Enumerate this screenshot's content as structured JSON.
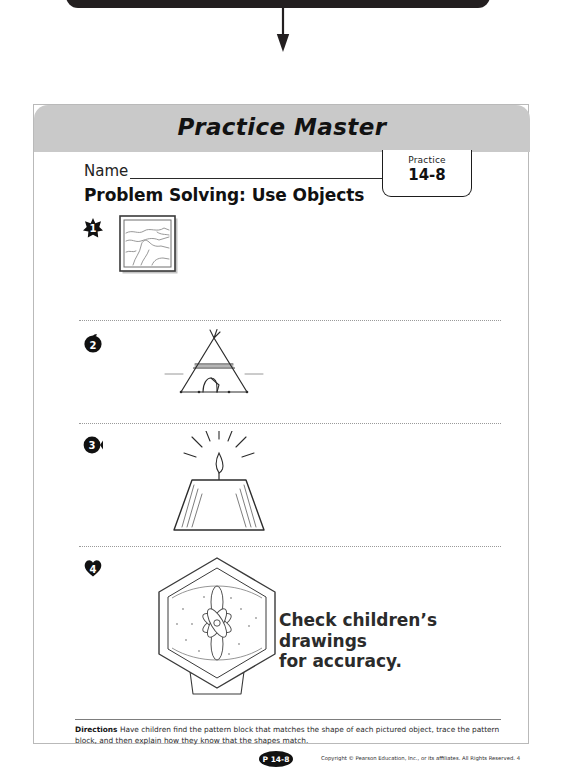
{
  "header": {
    "title": "Practice Master"
  },
  "name_field": {
    "label": "Name",
    "value": "",
    "placeholder": ""
  },
  "practice_tab": {
    "word": "Practice",
    "number": "14-8"
  },
  "lesson": {
    "title": "Problem Solving: Use Objects"
  },
  "problems": [
    {
      "number": "1",
      "marker_shape": "star",
      "art": "framed-landscape-picture",
      "art_description": "Square framed picture of a landscape"
    },
    {
      "number": "2",
      "marker_shape": "circle",
      "art": "teepee",
      "art_description": "Triangular teepee tent"
    },
    {
      "number": "3",
      "marker_shape": "circle",
      "art": "lampshade-with-flame",
      "art_description": "Trapezoid lampshade with lit flame above"
    },
    {
      "number": "4",
      "marker_shape": "heart",
      "art": "hexagonal-box-with-flower",
      "art_description": "Hexagonal box with a flower design"
    }
  ],
  "answer_note": {
    "line1": "Check children’s drawings",
    "line2": "for accuracy."
  },
  "footer": {
    "directions_label": "Directions",
    "directions_text": "Have children find the pattern block that matches the shape of each pictured object, trace the pattern block, and then explain how they know that the shapes match.",
    "page_badge": "P 14-8",
    "copyright": "Copyright © Pearson Education, Inc., or its affiliates. All Rights Reserved. 4"
  },
  "colors": {
    "header_band": "#c9c9c9",
    "ink": "#1a1a1a",
    "badge": "#111111",
    "arrow": "#231f20"
  }
}
